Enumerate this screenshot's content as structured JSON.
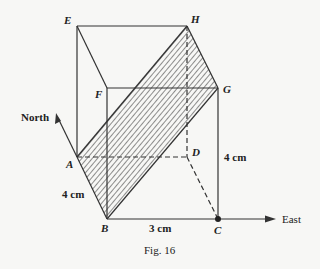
{
  "figure": {
    "caption": "Fig. 16",
    "points": {
      "A": {
        "label": "A",
        "x": 77,
        "y": 157
      },
      "B": {
        "label": "B",
        "x": 107,
        "y": 219
      },
      "C": {
        "label": "C",
        "x": 218,
        "y": 219
      },
      "D": {
        "label": "D",
        "x": 187,
        "y": 157
      },
      "E": {
        "label": "E",
        "x": 77,
        "y": 26
      },
      "F": {
        "label": "F",
        "x": 107,
        "y": 88
      },
      "G": {
        "label": "G",
        "x": 218,
        "y": 88
      },
      "H": {
        "label": "H",
        "x": 187,
        "y": 26
      }
    },
    "dimensions": {
      "ab": "4 cm",
      "bc": "3 cm",
      "cg": "4 cm"
    },
    "directions": {
      "north": "North",
      "east": "East"
    },
    "shaded_plane": "ABGH",
    "colors": {
      "line": "#333333",
      "background": "#f7f7f5"
    }
  }
}
